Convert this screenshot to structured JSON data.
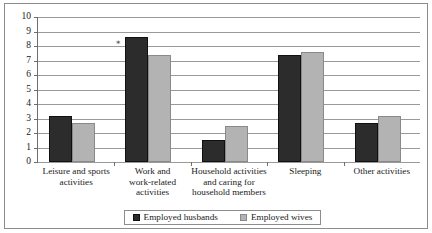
{
  "chart_data": {
    "type": "bar",
    "title": "",
    "subtitle": "",
    "xlabel": "",
    "ylabel": "",
    "ylim": [
      0,
      10
    ],
    "ytick_step": 1,
    "ytick_labels": [
      "10",
      "9",
      "8",
      "7",
      "6",
      "5",
      "4",
      "3",
      "2",
      "1",
      "0"
    ],
    "grid": true,
    "legend_position": "bottom",
    "categories": [
      "Leisure and sports activities",
      "Work and work-related activities",
      "Household activities and caring for household members",
      "Sleeping",
      "Other activities"
    ],
    "category_label_lines": [
      [
        "Leisure and sports",
        "activities"
      ],
      [
        "Work and",
        "work-related",
        "activities"
      ],
      [
        "Household activities",
        "and caring for",
        "household members"
      ],
      [
        "Sleeping"
      ],
      [
        "Other activities"
      ]
    ],
    "series": [
      {
        "name": "Employed husbands",
        "color": "#2c2c2c",
        "values": [
          3.2,
          8.6,
          1.5,
          7.4,
          2.7
        ]
      },
      {
        "name": "Employed wives",
        "color": "#b3b3b3",
        "values": [
          2.7,
          7.4,
          2.5,
          7.6,
          3.2
        ]
      }
    ],
    "annotations": [
      {
        "text": "∗",
        "category_index": 1,
        "series_index": 0,
        "value": 8.6
      }
    ]
  },
  "legend": {
    "entries": [
      {
        "label": "Employed husbands",
        "swatch": "dark-square-icon"
      },
      {
        "label": "Employed wives",
        "swatch": "light-square-icon"
      }
    ]
  },
  "colors": {
    "series_dark": "#2c2c2c",
    "series_light": "#b3b3b3",
    "gridline": "#9a9a9a",
    "axis": "#6e6e6e",
    "frame": "#8d8d8d",
    "background": "#ffffff",
    "text": "#1a1a1a"
  }
}
